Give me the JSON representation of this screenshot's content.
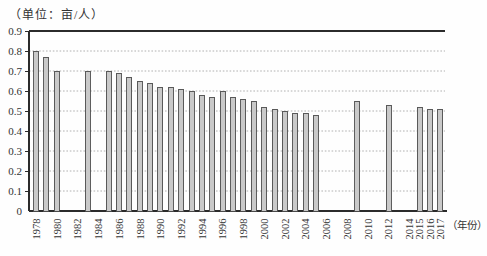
{
  "chart_data": {
    "type": "bar",
    "title": "（单位：亩/人）",
    "xlabel": "（年份）",
    "ylabel": "",
    "ylim": [
      0,
      0.9
    ],
    "ytick_step": 0.1,
    "ytick_labels": [
      "0.9",
      "0.8",
      "0.7",
      "0.6",
      "0.5",
      "0.4",
      "0.3",
      "0.2",
      "0.1",
      "0"
    ],
    "grid": "horizontal-dotted",
    "legend": "none",
    "bar_fill_color": "#c9c9c9",
    "bar_border_color": "#4d4d4d",
    "axis_color": "#2b2b2b",
    "gridline_color": "#9a9a9a",
    "categories": [
      1978,
      1979,
      1980,
      1981,
      1982,
      1983,
      1984,
      1985,
      1986,
      1987,
      1988,
      1989,
      1990,
      1991,
      1992,
      1993,
      1994,
      1995,
      1996,
      1997,
      1998,
      1999,
      2000,
      2001,
      2002,
      2003,
      2004,
      2005,
      2006,
      2007,
      2008,
      2009,
      2010,
      2011,
      2012,
      2013,
      2014,
      2015,
      2016,
      2017
    ],
    "values": [
      0.8,
      0.77,
      0.7,
      null,
      null,
      0.7,
      null,
      0.7,
      0.69,
      0.67,
      0.65,
      0.64,
      0.62,
      0.62,
      0.61,
      0.6,
      0.58,
      0.57,
      0.6,
      0.57,
      0.56,
      0.55,
      0.52,
      0.51,
      0.5,
      0.49,
      0.49,
      0.48,
      null,
      null,
      null,
      0.55,
      null,
      null,
      0.53,
      null,
      null,
      0.52,
      0.51,
      0.51
    ],
    "xtick_labels": [
      "1978",
      "1980",
      "1982",
      "1984",
      "1986",
      "1988",
      "1990",
      "1992",
      "1994",
      "1996",
      "1998",
      "2000",
      "2002",
      "2004",
      "2006",
      "2008",
      "2010",
      "2012",
      "2014",
      "2015",
      "2016",
      "2017"
    ]
  }
}
